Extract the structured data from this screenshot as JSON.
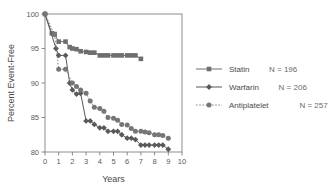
{
  "chart_data": {
    "type": "line",
    "title": "",
    "xlabel": "Years",
    "ylabel": "Percent Event-Free",
    "xlim": [
      0,
      10
    ],
    "ylim": [
      80,
      100
    ],
    "xticks": [
      "0",
      "1",
      "2",
      "3",
      "4",
      "5",
      "6",
      "7",
      "8",
      "9",
      "10"
    ],
    "yticks": [
      "80",
      "85",
      "90",
      "95",
      "100"
    ],
    "grid": false,
    "legend_position": "right",
    "series": [
      {
        "name": "Statin",
        "n_label": "N = 196",
        "n": 196,
        "marker": "square",
        "linestyle": "solid",
        "color": "#6e6e6e",
        "x": [
          0,
          0.5,
          0.7,
          1.0,
          1.5,
          1.8,
          2.0,
          2.3,
          2.6,
          3.0,
          3.3,
          3.6,
          4.0,
          4.3,
          4.6,
          5.0,
          5.3,
          5.6,
          6.0,
          6.3,
          6.6,
          7.0
        ],
        "y": [
          100,
          97.2,
          97.1,
          96.0,
          96.0,
          95.2,
          95.0,
          94.9,
          94.6,
          94.5,
          94.4,
          94.4,
          94.0,
          94.0,
          94.0,
          94.0,
          94.0,
          94.0,
          94.0,
          94.0,
          94.0,
          93.5
        ]
      },
      {
        "name": "Warfarin",
        "n_label": "N = 206",
        "n": 206,
        "marker": "diamond",
        "linestyle": "solid",
        "color": "#595959",
        "x": [
          0,
          0.8,
          1.0,
          1.5,
          1.8,
          2.0,
          2.3,
          2.6,
          3.0,
          3.3,
          3.6,
          4.0,
          4.3,
          4.6,
          5.0,
          5.3,
          5.6,
          6.0,
          6.3,
          6.6,
          7.0,
          7.3,
          7.6,
          8.0,
          8.3,
          8.6,
          9.0
        ],
        "y": [
          100,
          95.0,
          94.0,
          94.0,
          90.0,
          89.0,
          88.4,
          88.5,
          84.5,
          84.5,
          84.0,
          83.5,
          83.5,
          83.0,
          83.0,
          83.0,
          82.5,
          82.0,
          82.0,
          81.8,
          81.0,
          81.0,
          81.0,
          81.0,
          81.0,
          81.0,
          80.4
        ]
      },
      {
        "name": "Antiplatelet",
        "n_label": "N = 257",
        "n": 257,
        "marker": "circle",
        "linestyle": "dotted",
        "color": "#767676",
        "x": [
          0,
          0.7,
          1.0,
          1.5,
          2.0,
          2.3,
          2.6,
          3.0,
          3.3,
          3.6,
          4.0,
          4.3,
          4.6,
          5.0,
          5.3,
          5.6,
          6.0,
          6.3,
          6.6,
          7.0,
          7.3,
          7.6,
          8.0,
          8.3,
          8.6,
          9.0
        ],
        "y": [
          100,
          97.0,
          92.0,
          92.0,
          90.0,
          89.5,
          89.0,
          88.5,
          87.4,
          86.5,
          86.3,
          85.9,
          85.0,
          84.9,
          84.6,
          84.0,
          83.9,
          83.4,
          83.0,
          83.0,
          82.9,
          82.8,
          82.5,
          82.5,
          82.4,
          82.0
        ]
      }
    ]
  },
  "axis": {
    "y_title": "Percent Event-Free",
    "x_title": "Years"
  },
  "legend": {
    "entries": [
      {
        "label": "Statin",
        "n_label": "N = 196"
      },
      {
        "label": "Warfarin",
        "n_label": "N = 206"
      },
      {
        "label": "Antiplatelet",
        "n_label": "N = 257"
      }
    ]
  }
}
